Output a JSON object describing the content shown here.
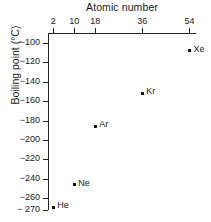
{
  "chart_data": {
    "type": "scatter",
    "title": "",
    "xlabel": "Atomic number",
    "ylabel": "Boiling point (°C)",
    "xlim": [
      0,
      56.5
    ],
    "ylim": [
      -272,
      -90
    ],
    "grid": false,
    "legend": "none",
    "x_axis_position": "top",
    "y_axis_position": "left",
    "xticks": [
      {
        "value": 2,
        "label": "2"
      },
      {
        "value": 10,
        "label": "10"
      },
      {
        "value": 18,
        "label": "18"
      },
      {
        "value": 36,
        "label": "36"
      },
      {
        "value": 54,
        "label": "54"
      }
    ],
    "yticks": [
      {
        "value": -100,
        "label": "−100"
      },
      {
        "value": -120,
        "label": "−120"
      },
      {
        "value": -140,
        "label": "−140"
      },
      {
        "value": -160,
        "label": "−160"
      },
      {
        "value": -180,
        "label": "−180"
      },
      {
        "value": -200,
        "label": "−200"
      },
      {
        "value": -220,
        "label": "−220"
      },
      {
        "value": -240,
        "label": "−240"
      },
      {
        "value": -260,
        "label": "−260"
      },
      {
        "value": -270,
        "label": "− 270"
      }
    ],
    "series": [
      {
        "name": "Noble gases",
        "marker": "square",
        "color": "#111111",
        "points": [
          {
            "label": "He",
            "x": 2,
            "y": -269
          },
          {
            "label": "Ne",
            "x": 10,
            "y": -246
          },
          {
            "label": "Ar",
            "x": 18,
            "y": -186
          },
          {
            "label": "Kr",
            "x": 36,
            "y": -152
          },
          {
            "label": "Xe",
            "x": 54,
            "y": -108
          }
        ]
      }
    ]
  }
}
